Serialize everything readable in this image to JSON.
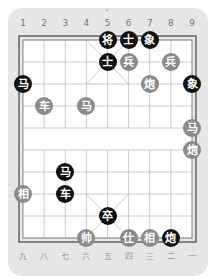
{
  "board": {
    "top_labels": [
      "1",
      "2",
      "3",
      "4",
      "5",
      "6",
      "7",
      "8",
      "9"
    ],
    "bottom_labels": [
      "九",
      "八",
      "七",
      "六",
      "五",
      "四",
      "三",
      "二",
      "一"
    ],
    "colors": {
      "background": "#e6e6e6",
      "board": "#ffffff",
      "lines": "#999999",
      "black_piece": "#111111",
      "red_piece": "#8a8a8a"
    }
  },
  "pieces": [
    {
      "char": "将",
      "side": "black",
      "col": 5,
      "row": 0
    },
    {
      "char": "士",
      "side": "black",
      "col": 6,
      "row": 0
    },
    {
      "char": "象",
      "side": "black",
      "col": 7,
      "row": 0
    },
    {
      "char": "士",
      "side": "black",
      "col": 5,
      "row": 1
    },
    {
      "char": "兵",
      "side": "red",
      "col": 6,
      "row": 1
    },
    {
      "char": "兵",
      "side": "red",
      "col": 8,
      "row": 1
    },
    {
      "char": "马",
      "side": "black",
      "col": 1,
      "row": 2
    },
    {
      "char": "炮",
      "side": "red",
      "col": 7,
      "row": 2
    },
    {
      "char": "象",
      "side": "black",
      "col": 9,
      "row": 2
    },
    {
      "char": "车",
      "side": "red",
      "col": 2,
      "row": 3
    },
    {
      "char": "马",
      "side": "red",
      "col": 4,
      "row": 3
    },
    {
      "char": "马",
      "side": "red",
      "col": 9,
      "row": 4
    },
    {
      "char": "炮",
      "side": "red",
      "col": 9,
      "row": 5
    },
    {
      "char": "马",
      "side": "black",
      "col": 3,
      "row": 6
    },
    {
      "char": "相",
      "side": "red",
      "col": 1,
      "row": 7
    },
    {
      "char": "车",
      "side": "black",
      "col": 3,
      "row": 7
    },
    {
      "char": "卒",
      "side": "black",
      "col": 5,
      "row": 8
    },
    {
      "char": "帅",
      "side": "red",
      "col": 4,
      "row": 9
    },
    {
      "char": "仕",
      "side": "red",
      "col": 6,
      "row": 9
    },
    {
      "char": "相",
      "side": "red",
      "col": 7,
      "row": 9
    },
    {
      "char": "炮",
      "side": "black",
      "col": 8,
      "row": 9
    }
  ]
}
